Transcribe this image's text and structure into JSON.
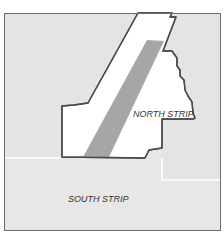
{
  "map": {
    "regions": [
      {
        "id": "north-strip",
        "label": "NORTH STRIP",
        "fill": "#ffffff",
        "stroke": "#4a4a4a"
      },
      {
        "id": "south-strip",
        "label": "SOUTH STRIP",
        "fill": "#e6e6e6"
      }
    ],
    "band": {
      "fill": "#a6a6a6"
    },
    "colors": {
      "background": "#e4e4e4",
      "frame": "#6e6e6e",
      "boundary_line": "#ffffff",
      "polygon_border": "#4a4a4a",
      "band": "#a6a6a6"
    }
  }
}
